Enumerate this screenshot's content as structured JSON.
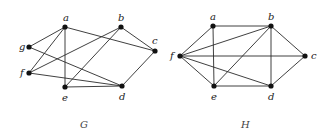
{
  "graphs": [
    {
      "name": "G",
      "caption": "G",
      "caption_pos": [
        80,
        128
      ],
      "vertices": [
        {
          "id": "a",
          "label": "a",
          "x": 65,
          "y": 27,
          "lx": 63,
          "ly": 21
        },
        {
          "id": "b",
          "label": "b",
          "x": 121,
          "y": 27,
          "lx": 118,
          "ly": 21
        },
        {
          "id": "c",
          "label": "c",
          "x": 155,
          "y": 51,
          "lx": 152,
          "ly": 44
        },
        {
          "id": "g",
          "label": "g",
          "x": 29,
          "y": 47,
          "lx": 19,
          "ly": 50
        },
        {
          "id": "f",
          "label": "f",
          "x": 29,
          "y": 73,
          "lx": 20,
          "ly": 76
        },
        {
          "id": "e",
          "label": "e",
          "x": 65,
          "y": 87,
          "lx": 62,
          "ly": 101
        },
        {
          "id": "d",
          "label": "d",
          "x": 122,
          "y": 86,
          "lx": 119,
          "ly": 100
        }
      ],
      "edges": [
        [
          "a",
          "g"
        ],
        [
          "a",
          "f"
        ],
        [
          "a",
          "e"
        ],
        [
          "a",
          "c"
        ],
        [
          "b",
          "f"
        ],
        [
          "b",
          "e"
        ],
        [
          "b",
          "c"
        ],
        [
          "g",
          "d"
        ],
        [
          "f",
          "d"
        ],
        [
          "e",
          "d"
        ],
        [
          "c",
          "d"
        ]
      ]
    },
    {
      "name": "H",
      "caption": "H",
      "caption_pos": [
        241,
        128
      ],
      "vertices": [
        {
          "id": "a",
          "label": "a",
          "x": 213,
          "y": 26,
          "lx": 210,
          "ly": 20
        },
        {
          "id": "b",
          "label": "b",
          "x": 271,
          "y": 26,
          "lx": 268,
          "ly": 20
        },
        {
          "id": "c",
          "label": "c",
          "x": 305,
          "y": 56,
          "lx": 311,
          "ly": 59
        },
        {
          "id": "f",
          "label": "f",
          "x": 180,
          "y": 56,
          "lx": 170,
          "ly": 59
        },
        {
          "id": "e",
          "label": "e",
          "x": 214,
          "y": 86,
          "lx": 211,
          "ly": 100
        },
        {
          "id": "d",
          "label": "d",
          "x": 271,
          "y": 86,
          "lx": 268,
          "ly": 100
        }
      ],
      "edges": [
        [
          "a",
          "b"
        ],
        [
          "a",
          "f"
        ],
        [
          "a",
          "e"
        ],
        [
          "f",
          "b"
        ],
        [
          "f",
          "c"
        ],
        [
          "f",
          "e"
        ],
        [
          "f",
          "d"
        ],
        [
          "b",
          "e"
        ],
        [
          "b",
          "d"
        ],
        [
          "b",
          "c"
        ],
        [
          "c",
          "d"
        ],
        [
          "e",
          "d"
        ]
      ]
    }
  ],
  "style": {
    "edge_color": "#2a2a2a",
    "node_color": "#111111",
    "node_radius": 2.6
  }
}
